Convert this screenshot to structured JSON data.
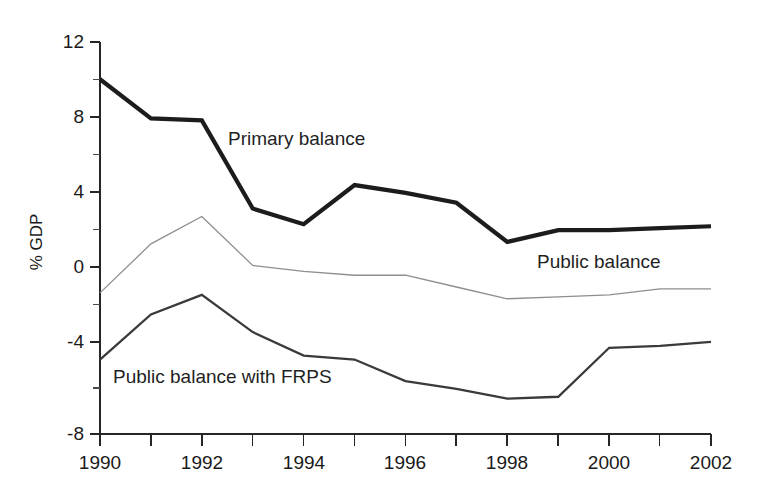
{
  "chart_data": {
    "type": "line",
    "title": "",
    "xlabel": "",
    "ylabel": "% GDP",
    "x": [
      1990,
      1991,
      1992,
      1993,
      1994,
      1995,
      1996,
      1997,
      1998,
      1999,
      2000,
      2001,
      2002
    ],
    "xlim": [
      1990,
      2002
    ],
    "ylim": [
      -8,
      12
    ],
    "yticks": [
      -8,
      -4,
      0,
      4,
      8,
      12
    ],
    "ytick_labels": [
      "-8",
      "-4",
      "0",
      "4",
      "8",
      "12"
    ],
    "xticks": [
      1990,
      1991,
      1992,
      1993,
      1994,
      1995,
      1996,
      1997,
      1998,
      1999,
      2000,
      2001,
      2002
    ],
    "xtick_labels": [
      "1990",
      "",
      "1992",
      "",
      "1994",
      "",
      "1996",
      "",
      "1998",
      "",
      "2000",
      "",
      "2002"
    ],
    "grid": false,
    "legend": "inline-annotations",
    "series": [
      {
        "name": "Primary balance",
        "color": "#1c1c1c",
        "linewidth": "thick",
        "values": [
          10.1,
          8.1,
          8.0,
          3.5,
          2.7,
          4.7,
          4.3,
          3.8,
          1.8,
          2.4,
          2.4,
          2.5,
          2.6
        ]
      },
      {
        "name": "Public balance",
        "color": "#8e8e8e",
        "linewidth": "thin",
        "values": [
          -0.8,
          1.7,
          3.1,
          0.6,
          0.3,
          0.1,
          0.1,
          -0.5,
          -1.1,
          -1.0,
          -0.9,
          -0.6,
          -0.6
        ]
      },
      {
        "name": "Public balance with FRPS",
        "color": "#3a3a3a",
        "linewidth": "medium",
        "values": [
          -4.2,
          -1.9,
          -0.9,
          -2.8,
          -4.0,
          -4.2,
          -5.3,
          -5.7,
          -6.2,
          -6.1,
          -3.6,
          -3.5,
          -3.3
        ]
      }
    ],
    "annotations": [
      {
        "text": "Primary balance",
        "x": 1993.1,
        "y": 6.0
      },
      {
        "text": "Public balance",
        "x": 1999.1,
        "y": 0.2
      },
      {
        "text": "Public balance with FRPS",
        "x": 1990.4,
        "y": -5.3
      }
    ]
  },
  "axis": {
    "ylabel": "% GDP"
  },
  "yticks": [
    {
      "label": "12"
    },
    {
      "label": "8"
    },
    {
      "label": "4"
    },
    {
      "label": "0"
    },
    {
      "label": "-4"
    },
    {
      "label": "-8"
    }
  ],
  "xticks": [
    {
      "label": "1990"
    },
    {
      "label": "1992"
    },
    {
      "label": "1994"
    },
    {
      "label": "1996"
    },
    {
      "label": "1998"
    },
    {
      "label": "2000"
    },
    {
      "label": "2002"
    }
  ],
  "annotations": [
    {
      "label": "Primary balance"
    },
    {
      "label": "Public balance"
    },
    {
      "label": "Public balance with FRPS"
    }
  ]
}
